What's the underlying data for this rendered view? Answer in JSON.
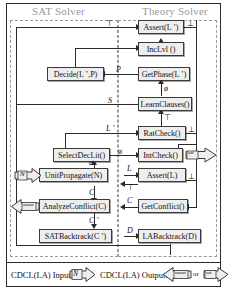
{
  "diagram": {
    "columns": [
      {
        "name": "sat_solver",
        "label": "SAT Solver"
      },
      {
        "name": "theory_solver",
        "label": "Theory Solver"
      }
    ],
    "nodes": [
      {
        "id": "assert_lp",
        "label": "Assert(L ’)",
        "side": "theory"
      },
      {
        "id": "inclvl",
        "label": "IncLvl ()",
        "side": "theory"
      },
      {
        "id": "decide",
        "label": "Decide(L ’,P)",
        "side": "sat"
      },
      {
        "id": "getphase",
        "label": "GetPhase(L ’)",
        "side": "theory"
      },
      {
        "id": "learnclauses",
        "label": "LearnClauses()",
        "side": "theory"
      },
      {
        "id": "ratcheck",
        "label": "RatCheck()",
        "side": "theory"
      },
      {
        "id": "selectdeclit",
        "label": "SelectDecLit()",
        "side": "sat"
      },
      {
        "id": "intcheck",
        "label": "IntCheck()",
        "side": "theory"
      },
      {
        "id": "unitpropagate",
        "label": "UnitPropagate(N)",
        "side": "sat"
      },
      {
        "id": "assert_l",
        "label": "Assert(L)",
        "side": "theory"
      },
      {
        "id": "analyzeconflict",
        "label": "AnalyzeConflict(C)",
        "side": "sat"
      },
      {
        "id": "getconflict",
        "label": "GetConflict()",
        "side": "theory"
      },
      {
        "id": "satbacktrack",
        "label": "SATBacktrack(C ’)",
        "side": "sat"
      },
      {
        "id": "labacktrack",
        "label": "LABacktrack(D)",
        "side": "theory"
      }
    ],
    "edge_labels": [
      {
        "id": "top_true",
        "label": "⊤"
      },
      {
        "id": "assert_lp_bot",
        "label": "⊥"
      },
      {
        "id": "phase_p",
        "label": "P"
      },
      {
        "id": "getphase_empty",
        "label": "ø"
      },
      {
        "id": "learn_s",
        "label": "S"
      },
      {
        "id": "ratcheck_true",
        "label": "⊤"
      },
      {
        "id": "ratcheck_lp",
        "label": "L ’"
      },
      {
        "id": "ratcheck_bot",
        "label": "⊥"
      },
      {
        "id": "intcheck_empty",
        "label": "ø"
      },
      {
        "id": "unit_empty",
        "label": "ø"
      },
      {
        "id": "assert_l_in",
        "label": "L"
      },
      {
        "id": "assert_l_true",
        "label": "⊤"
      },
      {
        "id": "assert_l_bot",
        "label": "⊥"
      },
      {
        "id": "conflict_c_in",
        "label": "C"
      },
      {
        "id": "conflict_c",
        "label": "C"
      },
      {
        "id": "backtrack_cp",
        "label": "C ’"
      },
      {
        "id": "backtrack_d",
        "label": "D"
      }
    ],
    "io_markers": [
      {
        "id": "input_n",
        "label": "N"
      },
      {
        "id": "output_unsat",
        "label": "unsat"
      },
      {
        "id": "output_sat",
        "label": "sat"
      },
      {
        "id": "intcheck_sat",
        "label": "sat"
      }
    ]
  },
  "legend": {
    "input_text": "CDCL(LA) Input:",
    "input_symbol": "N",
    "output_text": "CDCL(LA) Output:",
    "output_unsat": "unsat",
    "or_text": "or",
    "output_sat": "sat"
  },
  "colors": {
    "box_fill": "#eeeeee",
    "box_stroke": "#3a3a3a",
    "line": "#2b2b2b",
    "region_dash": "#9a9a9a",
    "header_text": "#9a9a9a"
  }
}
